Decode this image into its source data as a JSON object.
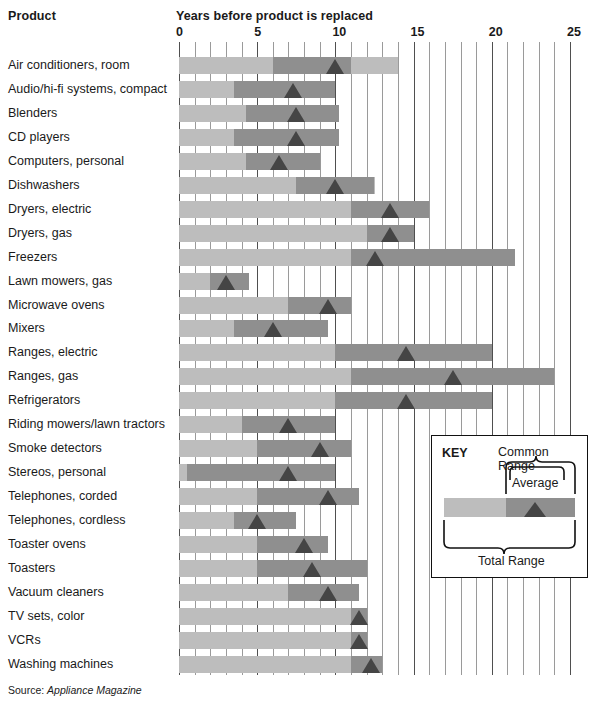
{
  "header": {
    "product_column": "Product",
    "years_column": "Years before product is replaced"
  },
  "axis": {
    "ticks": [
      "0",
      "5",
      "10",
      "15",
      "20",
      "25"
    ],
    "min": 0,
    "max": 25,
    "minor_step": 1
  },
  "key": {
    "title": "KEY",
    "common_range_label": "Common Range",
    "average_label": "Average",
    "total_range_label": "Total Range"
  },
  "source": {
    "label": "Source:",
    "name": "Appliance Magazine"
  },
  "colors": {
    "total_range": "#bdbdbd",
    "common_range": "#8f8f8f",
    "average_marker": "#454545",
    "gridline": "#6e6e6e",
    "text": "#1a1a1a"
  },
  "chart_data": {
    "type": "bar",
    "title": "Years before product is replaced",
    "xlabel": "Years before product is replaced",
    "ylabel": "Product",
    "xlim": [
      0,
      25
    ],
    "grid": true,
    "legend": [
      "Total Range",
      "Common Range",
      "Average"
    ],
    "legend_position": "inset-bottom-right",
    "value_fields": [
      "total_min",
      "total_max",
      "common_min",
      "common_max",
      "average"
    ],
    "categories": [
      "Air conditioners, room",
      "Audio/hi-fi systems, compact",
      "Blenders",
      "CD players",
      "Computers, personal",
      "Dishwashers",
      "Dryers, electric",
      "Dryers, gas",
      "Freezers",
      "Lawn mowers, gas",
      "Microwave ovens",
      "Mixers",
      "Ranges, electric",
      "Ranges, gas",
      "Refrigerators",
      "Riding mowers/lawn tractors",
      "Smoke detectors",
      "Stereos, personal",
      "Telephones, corded",
      "Telephones, cordless",
      "Toaster ovens",
      "Toasters",
      "Vacuum cleaners",
      "TV sets, color",
      "VCRs",
      "Washing machines"
    ],
    "rows": [
      {
        "label": "Air conditioners, room",
        "total_min": 0,
        "total_max": 14,
        "common_min": 6,
        "common_max": 11,
        "average": 10
      },
      {
        "label": "Audio/hi-fi systems, compact",
        "total_min": 0,
        "total_max": 10,
        "common_min": 3.5,
        "common_max": 10,
        "average": 7.3
      },
      {
        "label": "Blenders",
        "total_min": 0,
        "total_max": 10.2,
        "common_min": 4.3,
        "common_max": 10.2,
        "average": 7.5
      },
      {
        "label": "CD players",
        "total_min": 0,
        "total_max": 10.2,
        "common_min": 3.5,
        "common_max": 10.2,
        "average": 7.5
      },
      {
        "label": "Computers, personal",
        "total_min": 0,
        "total_max": 9,
        "common_min": 4.3,
        "common_max": 9,
        "average": 6.4
      },
      {
        "label": "Dishwashers",
        "total_min": 0,
        "total_max": 12.5,
        "common_min": 7.5,
        "common_max": 12.5,
        "average": 10
      },
      {
        "label": "Dryers, electric",
        "total_min": 0,
        "total_max": 16,
        "common_min": 11,
        "common_max": 16,
        "average": 13.5
      },
      {
        "label": "Dryers, gas",
        "total_min": 0,
        "total_max": 15,
        "common_min": 12,
        "common_max": 15,
        "average": 13.5
      },
      {
        "label": "Freezers",
        "total_min": 0,
        "total_max": 21.5,
        "common_min": 11,
        "common_max": 21.5,
        "average": 12.5
      },
      {
        "label": "Lawn mowers, gas",
        "total_min": 0,
        "total_max": 4.5,
        "common_min": 2,
        "common_max": 4.5,
        "average": 3
      },
      {
        "label": "Microwave ovens",
        "total_min": 0,
        "total_max": 11,
        "common_min": 7,
        "common_max": 11,
        "average": 9.5
      },
      {
        "label": "Mixers",
        "total_min": 0,
        "total_max": 9.5,
        "common_min": 3.5,
        "common_max": 9.5,
        "average": 6
      },
      {
        "label": "Ranges, electric",
        "total_min": 0,
        "total_max": 20,
        "common_min": 10,
        "common_max": 20,
        "average": 14.5
      },
      {
        "label": "Ranges, gas",
        "total_min": 0,
        "total_max": 24,
        "common_min": 11,
        "common_max": 24,
        "average": 17.5
      },
      {
        "label": "Refrigerators",
        "total_min": 0,
        "total_max": 20,
        "common_min": 10,
        "common_max": 20,
        "average": 14.5
      },
      {
        "label": "Riding mowers/lawn tractors",
        "total_min": 0,
        "total_max": 10,
        "common_min": 4,
        "common_max": 10,
        "average": 7
      },
      {
        "label": "Smoke detectors",
        "total_min": 0,
        "total_max": 11,
        "common_min": 5,
        "common_max": 11,
        "average": 9
      },
      {
        "label": "Stereos, personal",
        "total_min": 0,
        "total_max": 10,
        "common_min": 0.5,
        "common_max": 10,
        "average": 7
      },
      {
        "label": "Telephones, corded",
        "total_min": 0,
        "total_max": 11.5,
        "common_min": 5,
        "common_max": 11.5,
        "average": 9.5
      },
      {
        "label": "Telephones, cordless",
        "total_min": 0,
        "total_max": 7.5,
        "common_min": 3.5,
        "common_max": 7.5,
        "average": 5
      },
      {
        "label": "Toaster ovens",
        "total_min": 0,
        "total_max": 9.5,
        "common_min": 5,
        "common_max": 9.5,
        "average": 8
      },
      {
        "label": "Toasters",
        "total_min": 0,
        "total_max": 12,
        "common_min": 5,
        "common_max": 12,
        "average": 8.5
      },
      {
        "label": "Vacuum cleaners",
        "total_min": 0,
        "total_max": 11.5,
        "common_min": 7,
        "common_max": 11.5,
        "average": 9.5
      },
      {
        "label": "TV sets, color",
        "total_min": 0,
        "total_max": 12,
        "common_min": 11,
        "common_max": 12,
        "average": 11.5
      },
      {
        "label": "VCRs",
        "total_min": 0,
        "total_max": 12,
        "common_min": 11,
        "common_max": 12,
        "average": 11.5
      },
      {
        "label": "Washing machines",
        "total_min": 0,
        "total_max": 13,
        "common_min": 11,
        "common_max": 13,
        "average": 12.3
      }
    ]
  }
}
